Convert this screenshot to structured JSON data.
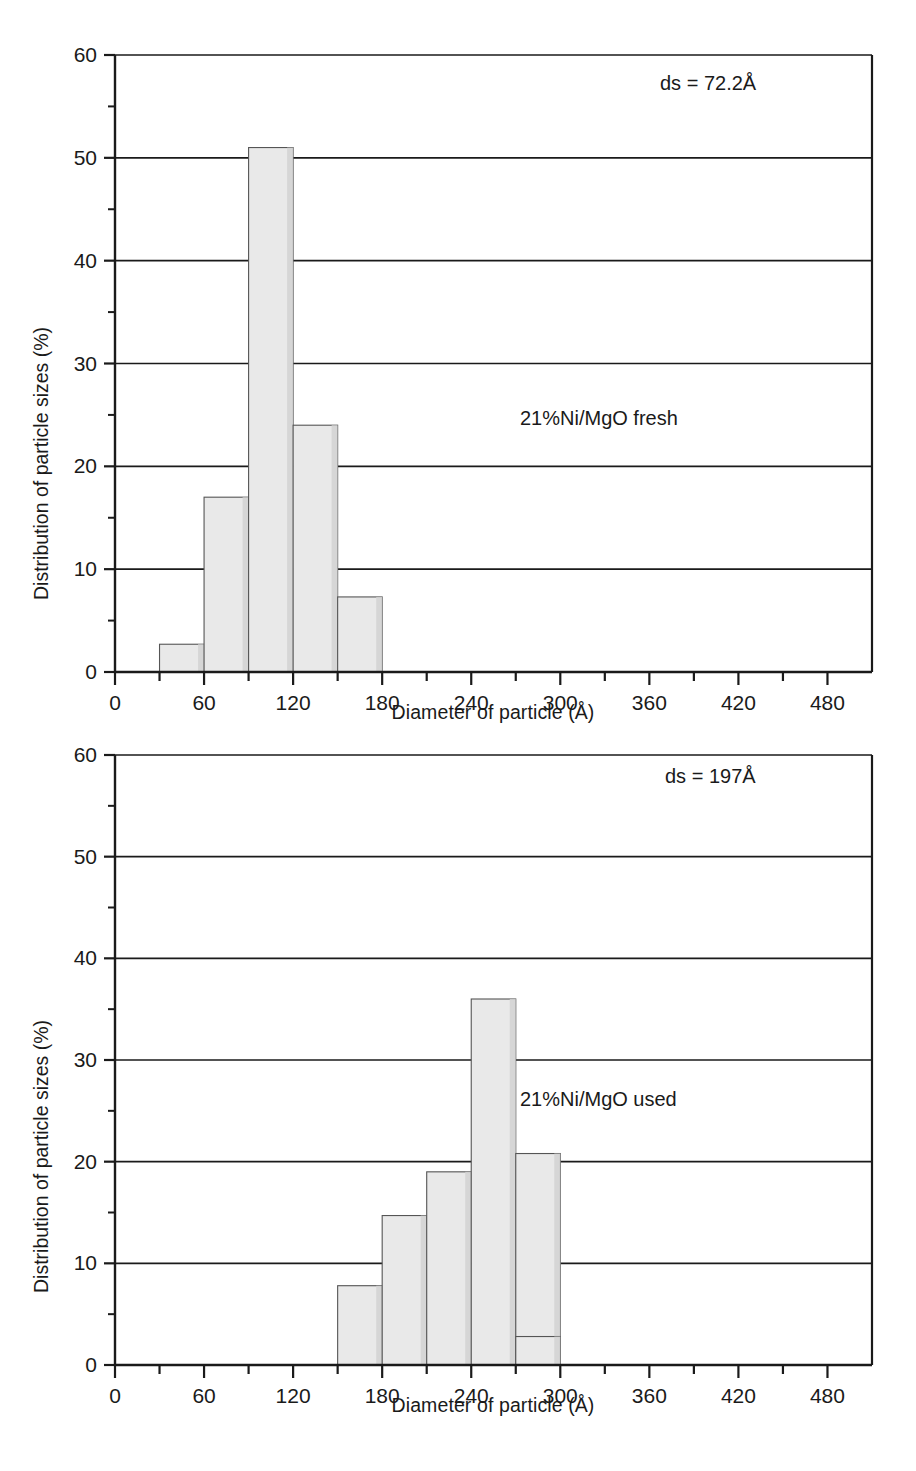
{
  "figure": {
    "background": "#ffffff",
    "axis_color": "#1a1a1a",
    "bar_fill": "#e9e9e9",
    "bar_edge": "#555555"
  },
  "common": {
    "xlabel": "Diameter of particle (Å)",
    "ylabel": "Distribution of particle sizes (%)",
    "x_tick_labels": [
      "0",
      "60",
      "120",
      "180",
      "240",
      "300",
      "360",
      "420",
      "480"
    ],
    "x_tick_values": [
      0,
      60,
      120,
      180,
      240,
      300,
      360,
      420,
      480
    ],
    "y_tick_labels": [
      "0",
      "10",
      "20",
      "30",
      "40",
      "50",
      "60"
    ],
    "y_tick_values": [
      0,
      10,
      20,
      30,
      40,
      50,
      60
    ]
  },
  "panels": [
    {
      "id": "top",
      "ds_label": "ds = 72.2Å",
      "sample_label": "21%Ni/MgO fresh"
    },
    {
      "id": "bottom",
      "ds_label": "ds = 197Å",
      "sample_label": "21%Ni/MgO used"
    }
  ],
  "chart_data": [
    {
      "type": "bar",
      "title": "21%Ni/MgO fresh",
      "annotation": "ds = 72.2Å",
      "xlabel": "Diameter of particle (Å)",
      "ylabel": "Distribution of particle sizes (%)",
      "xlim": [
        0,
        510
      ],
      "ylim": [
        0,
        60
      ],
      "xticks": [
        0,
        60,
        120,
        180,
        240,
        300,
        360,
        420,
        480
      ],
      "xtick_minor_step": 30,
      "yticks": [
        0,
        10,
        20,
        30,
        40,
        50,
        60
      ],
      "ytick_minor_step": 5,
      "grid": "horizontal-major",
      "legend": "none",
      "bin_edges": [
        30,
        60,
        90,
        120,
        150,
        180
      ],
      "categories": [
        "30-60",
        "60-90",
        "90-120",
        "120-150",
        "150-180"
      ],
      "values": [
        2.7,
        17.0,
        51.0,
        24.0,
        7.3
      ]
    },
    {
      "type": "bar",
      "title": "21%Ni/MgO used",
      "annotation": "ds = 197Å",
      "xlabel": "Diameter of particle (Å)",
      "ylabel": "Distribution of particle sizes (%)",
      "xlim": [
        0,
        510
      ],
      "ylim": [
        0,
        60
      ],
      "xticks": [
        0,
        60,
        120,
        180,
        240,
        300,
        360,
        420,
        480
      ],
      "xtick_minor_step": 30,
      "yticks": [
        0,
        10,
        20,
        30,
        40,
        50,
        60
      ],
      "ytick_minor_step": 5,
      "grid": "horizontal-major",
      "legend": "none",
      "bin_edges": [
        150,
        180,
        210,
        240,
        270,
        300
      ],
      "categories": [
        "150-180",
        "180-210",
        "210-240",
        "240-270",
        "270-300"
      ],
      "values": [
        7.8,
        14.7,
        19.0,
        36.0,
        20.8
      ],
      "extra_bars": [
        {
          "range": "270-300",
          "value": 2.8,
          "edges": [
            270,
            300
          ]
        }
      ]
    }
  ]
}
